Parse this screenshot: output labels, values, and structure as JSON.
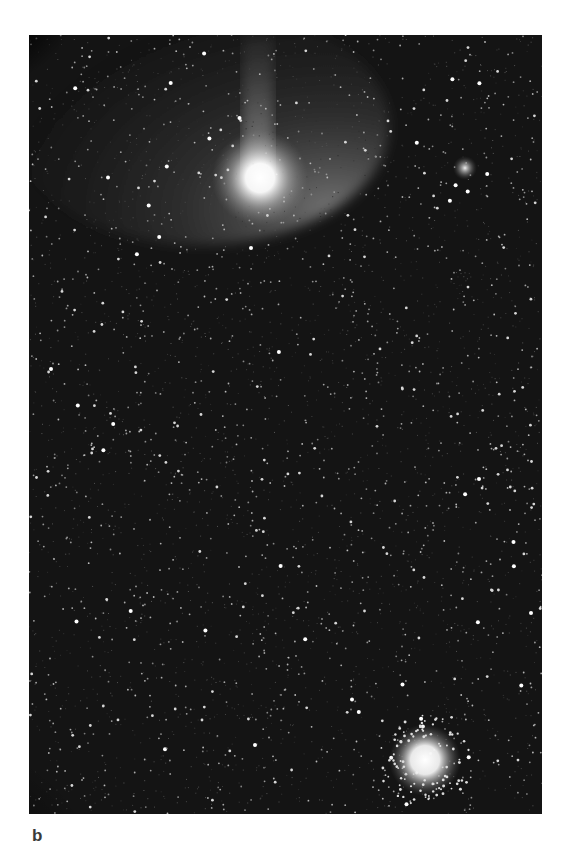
{
  "figure": {
    "panel_label": "b",
    "photo": {
      "description": "Astrophotograph of a comet with tail against a dense star field, with a fuzzy object upper right and a globular cluster lower right",
      "background_color": "#141414",
      "objects": [
        {
          "name": "comet-head",
          "cx": 231,
          "cy": 143,
          "r": 34,
          "color": "#ffffff"
        },
        {
          "name": "fuzzy-object",
          "cx": 436,
          "cy": 133,
          "r": 9,
          "color": "#e8e8e8"
        },
        {
          "name": "globular-cluster",
          "cx": 396,
          "cy": 725,
          "r": 26,
          "color": "#ffffff"
        }
      ]
    }
  }
}
